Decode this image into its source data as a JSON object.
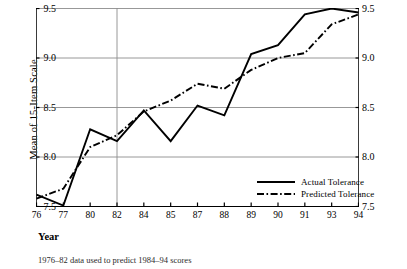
{
  "chart_data": {
    "type": "line",
    "title": "",
    "xlabel": "Year",
    "ylabel": "Mean of 15-Item Scale",
    "caption": "1976–82 data used to predict 1984–94 scores",
    "categories": [
      "76",
      "77",
      "80",
      "82",
      "84",
      "85",
      "87",
      "88",
      "89",
      "90",
      "91",
      "93",
      "94"
    ],
    "ylim": [
      7.5,
      9.5
    ],
    "yticks": [
      "7.5",
      "8.0",
      "8.5",
      "9.0",
      "9.5"
    ],
    "ytick_values": [
      7.5,
      8.0,
      8.5,
      9.0,
      9.5
    ],
    "grid": "horizontal",
    "dual_y_axis": true,
    "legend_position": "bottom-right",
    "divider_at_category": "82",
    "series": [
      {
        "name": "Actual Tolerance",
        "style": "solid",
        "color": "#000000",
        "values": [
          7.62,
          7.51,
          8.28,
          8.16,
          8.47,
          8.16,
          8.52,
          8.42,
          9.04,
          9.13,
          9.44,
          9.5,
          9.46
        ]
      },
      {
        "name": "Predicted Tolerance",
        "style": "dash-dot",
        "color": "#000000",
        "values": [
          7.58,
          7.68,
          8.1,
          8.22,
          8.46,
          8.57,
          8.74,
          8.69,
          8.88,
          9.0,
          9.05,
          9.34,
          9.44
        ]
      }
    ]
  },
  "axis": {
    "left_label": "Mean of 15-Item Scale",
    "bottom_label": "Year"
  },
  "legend": {
    "items": [
      {
        "label": "Actual Tolerance"
      },
      {
        "label": "Predicted Tolerance"
      }
    ]
  }
}
